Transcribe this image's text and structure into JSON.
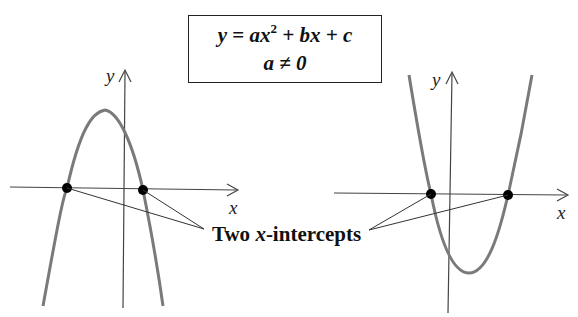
{
  "formula": {
    "line1_y": "y",
    "line1_eq": " = ",
    "line1_a": "a",
    "line1_x": "x",
    "line1_exp": "2",
    "line1_rest": " + bx + c",
    "line2": "a ≠ 0"
  },
  "left_graph": {
    "description": "Downward-opening parabola (a < 0) crossing x-axis twice",
    "x_axis_label": "x",
    "y_axis_label": "y",
    "opens": "down",
    "intercepts": 2
  },
  "right_graph": {
    "description": "Upward-opening parabola (a > 0) crossing x-axis twice",
    "x_axis_label": "x",
    "y_axis_label": "y",
    "opens": "up",
    "intercepts": 2
  },
  "callout": {
    "prefix": "Two ",
    "var": "x",
    "suffix": "-intercepts"
  },
  "colors": {
    "curve": "#7a7a7a",
    "axis": "#444444",
    "point": "#000000",
    "leader": "#333333"
  }
}
